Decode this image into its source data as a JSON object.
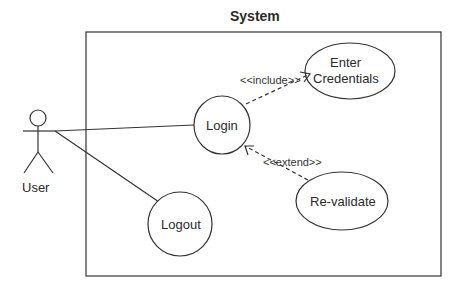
{
  "diagram": {
    "type": "uml-use-case",
    "system_label": "System",
    "actor": {
      "name": "User"
    },
    "use_cases": [
      {
        "id": "login",
        "label": "Login"
      },
      {
        "id": "enter_credentials",
        "label_line1": "Enter",
        "label_line2": "Credentials"
      },
      {
        "id": "revalidate",
        "label": "Re-validate"
      },
      {
        "id": "logout",
        "label": "Logout"
      }
    ],
    "relations": [
      {
        "from": "User",
        "to": "Login",
        "type": "association"
      },
      {
        "from": "User",
        "to": "Logout",
        "type": "association"
      },
      {
        "from": "Login",
        "to": "Enter Credentials",
        "type": "include",
        "label": "<<include>>"
      },
      {
        "from": "Re-validate",
        "to": "Login",
        "type": "extend",
        "label": "<<extend>>"
      }
    ],
    "colors": {
      "stroke": "#333333",
      "background": "#ffffff"
    }
  }
}
